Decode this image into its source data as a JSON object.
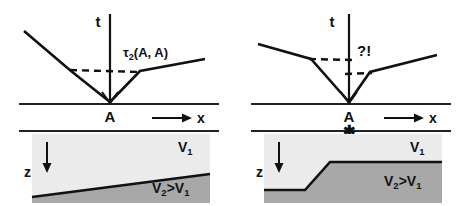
{
  "figure": {
    "title_text": "",
    "background_color": "#ffffff",
    "ink_color": "#111111",
    "layer1_color": "#ebebeb",
    "layer2_color": "#a8a8a8"
  },
  "panels": [
    {
      "id": "left",
      "name": "dipping-interface-panel",
      "traveltime": {
        "axis_label": "t",
        "annotation": "τ",
        "annotation_sub": "2",
        "annotation_tail": "(A, A)",
        "annotation_full": "τ2(A, A)"
      },
      "surface": {
        "source_label": "A",
        "x_axis_label": "x",
        "star_marker": ""
      },
      "model": {
        "depth_label": "z",
        "upper_velocity": "V",
        "upper_velocity_sub": "1",
        "lower_velocity": "V",
        "lower_velocity_sub": "2",
        "lower_velocity_rel": ">V",
        "lower_velocity_rel_sub": "1",
        "upper_velocity_full": "V1",
        "lower_velocity_full": "V2>V1",
        "interface_type": "dipping-planar"
      }
    },
    {
      "id": "right",
      "name": "step-interface-panel",
      "traveltime": {
        "axis_label": "t",
        "annotation": "?!",
        "annotation_sub": "",
        "annotation_tail": "",
        "annotation_full": "?!"
      },
      "surface": {
        "source_label": "A",
        "x_axis_label": "x",
        "star_marker": "✱"
      },
      "model": {
        "depth_label": "z",
        "upper_velocity": "V",
        "upper_velocity_sub": "1",
        "lower_velocity": "V",
        "lower_velocity_sub": "2",
        "lower_velocity_rel": ">V",
        "lower_velocity_rel_sub": "1",
        "upper_velocity_full": "V1",
        "lower_velocity_full": "V2>V1",
        "interface_type": "step-offset"
      }
    }
  ]
}
